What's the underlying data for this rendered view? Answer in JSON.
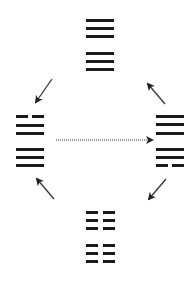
{
  "diagram": {
    "line_color": "#1a1a1a",
    "arrow_color": "#333333",
    "hexagrams": [
      {
        "name": "hexagram-top",
        "position": "top",
        "x": 86,
        "y": 19,
        "width": 28,
        "lines": [
          "solid",
          "solid",
          "solid",
          "solid",
          "solid",
          "solid"
        ],
        "line_y": [
          0,
          8,
          16,
          33,
          41,
          49
        ]
      },
      {
        "name": "hexagram-left",
        "position": "left",
        "x": 16,
        "y": 115,
        "width": 28,
        "lines": [
          "broken",
          "solid",
          "solid",
          "solid",
          "solid",
          "solid"
        ],
        "line_y": [
          0,
          9,
          17,
          33,
          41,
          49
        ]
      },
      {
        "name": "hexagram-right",
        "position": "right",
        "x": 156,
        "y": 115,
        "width": 28,
        "lines": [
          "solid",
          "solid",
          "solid",
          "solid",
          "solid",
          "broken"
        ],
        "line_y": [
          0,
          8,
          17,
          33,
          41,
          49
        ]
      },
      {
        "name": "hexagram-bottom",
        "position": "bottom",
        "x": 86,
        "y": 211,
        "width": 29,
        "lines": [
          "broken",
          "broken",
          "broken",
          "broken",
          "broken",
          "broken"
        ],
        "line_y": [
          0,
          8,
          16,
          33,
          41,
          49
        ]
      }
    ],
    "arrows": [
      {
        "name": "arrow-top-to-left",
        "x1": 52,
        "y1": 79,
        "x2": 36,
        "y2": 102,
        "style": "solid"
      },
      {
        "name": "arrow-right-to-top",
        "x1": 165,
        "y1": 104,
        "x2": 148,
        "y2": 84,
        "style": "solid"
      },
      {
        "name": "arrow-bottom-to-left",
        "x1": 54,
        "y1": 199,
        "x2": 37,
        "y2": 179,
        "style": "solid"
      },
      {
        "name": "arrow-right-to-bottom",
        "x1": 166,
        "y1": 179,
        "x2": 149,
        "y2": 199,
        "style": "solid"
      },
      {
        "name": "arrow-left-to-right-dotted",
        "x1": 56,
        "y1": 140,
        "x2": 152,
        "y2": 140,
        "style": "dotted"
      }
    ]
  }
}
